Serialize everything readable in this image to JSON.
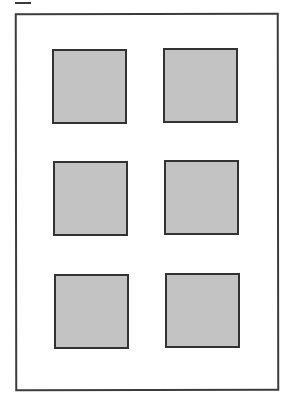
{
  "diagram": {
    "colors": {
      "background": "#ffffff",
      "frame_border": "#3c3c3c",
      "tile_fill": "#c3c3c3",
      "tile_border": "#333333"
    },
    "grid": {
      "rows": 3,
      "columns": 2
    },
    "tiles": [
      {
        "row": 1,
        "col": 1,
        "x": 52,
        "y": 49
      },
      {
        "row": 1,
        "col": 2,
        "x": 163,
        "y": 48
      },
      {
        "row": 2,
        "col": 1,
        "x": 53,
        "y": 161
      },
      {
        "row": 2,
        "col": 2,
        "x": 164,
        "y": 160
      },
      {
        "row": 3,
        "col": 1,
        "x": 54,
        "y": 274
      },
      {
        "row": 3,
        "col": 2,
        "x": 165,
        "y": 273
      }
    ]
  }
}
